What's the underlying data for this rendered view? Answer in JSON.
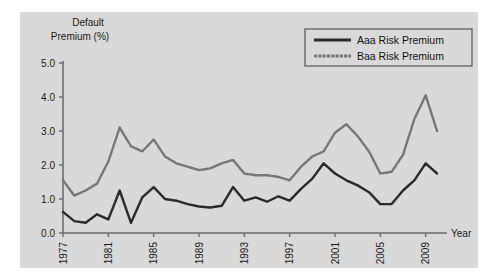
{
  "panel": {
    "background_color": "#d9d9d9",
    "page_background_color": "#ffffff"
  },
  "axis": {
    "y_title_line1": "Default",
    "y_title_line2": "Premium (%)",
    "x_title": "Year",
    "y_ticks": [
      "0.0",
      "1.0",
      "2.0",
      "3.0",
      "4.0",
      "5.0"
    ],
    "x_ticks": [
      "1977",
      "1981",
      "1985",
      "1989",
      "1993",
      "1997",
      "2001",
      "2005",
      "2009"
    ],
    "axis_color": "#6b6b6b"
  },
  "legend": {
    "border_color": "#555555",
    "background_color": "#d9d9d9",
    "items": [
      {
        "label": "Aaa Risk Premium",
        "color": "#2a2a2a",
        "style": "solid"
      },
      {
        "label": "Baa Risk Premium",
        "color": "#767676",
        "style": "dotted"
      }
    ]
  },
  "chart_data": {
    "type": "line",
    "title": "",
    "subtitle": "",
    "xlabel": "Year",
    "ylabel": "Default Premium (%)",
    "xlim": [
      1977,
      2010
    ],
    "ylim": [
      0.0,
      5.0
    ],
    "y_tick_values": [
      0.0,
      1.0,
      2.0,
      3.0,
      4.0,
      5.0
    ],
    "x_tick_values": [
      1977,
      1981,
      1985,
      1989,
      1993,
      1997,
      2001,
      2005,
      2009
    ],
    "grid": false,
    "legend_position": "top-right",
    "x": [
      1977,
      1978,
      1979,
      1980,
      1981,
      1982,
      1983,
      1984,
      1985,
      1986,
      1987,
      1988,
      1989,
      1990,
      1991,
      1992,
      1993,
      1994,
      1995,
      1996,
      1997,
      1998,
      1999,
      2000,
      2001,
      2002,
      2003,
      2004,
      2005,
      2006,
      2007,
      2008,
      2009,
      2010
    ],
    "series": [
      {
        "name": "Aaa Risk Premium",
        "color": "#2a2a2a",
        "style": "solid",
        "values": [
          0.62,
          0.35,
          0.3,
          0.55,
          0.4,
          1.25,
          0.3,
          1.05,
          1.35,
          1.0,
          0.95,
          0.85,
          0.78,
          0.75,
          0.8,
          1.35,
          0.95,
          1.05,
          0.92,
          1.08,
          0.95,
          1.3,
          1.6,
          2.05,
          1.75,
          1.55,
          1.4,
          1.2,
          0.85,
          0.85,
          1.25,
          1.55,
          2.05,
          1.75
        ]
      },
      {
        "name": "Baa Risk Premium",
        "color": "#767676",
        "style": "dotted",
        "values": [
          1.55,
          1.1,
          1.25,
          1.45,
          2.1,
          3.1,
          2.55,
          2.4,
          2.75,
          2.25,
          2.05,
          1.95,
          1.85,
          1.9,
          2.05,
          2.15,
          1.75,
          1.7,
          1.7,
          1.65,
          1.55,
          1.95,
          2.25,
          2.4,
          2.95,
          3.2,
          2.85,
          2.4,
          1.75,
          1.8,
          2.3,
          3.35,
          4.05,
          3.0
        ]
      }
    ]
  }
}
